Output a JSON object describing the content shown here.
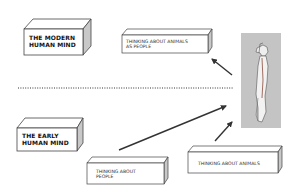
{
  "diagram": {
    "boxes": [
      {
        "id": "modern-mind",
        "lines": [
          "THE MODERN",
          "HUMAN MIND"
        ]
      },
      {
        "id": "animals-as-people",
        "lines": [
          "THINKING ABOUT ANIMALS",
          "AS PEOPLE"
        ]
      },
      {
        "id": "early-mind",
        "lines": [
          "THE EARLY",
          "HUMAN MIND"
        ]
      },
      {
        "id": "thinking-people",
        "lines": [
          "THINKING ABOUT",
          "PEOPLE"
        ]
      },
      {
        "id": "thinking-animals",
        "lines": [
          "THINKING ABOUT ANIMALS"
        ]
      }
    ],
    "figure": {
      "description": "human-animal hybrid figure",
      "background": "#c4c4c4"
    },
    "colors": {
      "stroke": "#333333",
      "side": "#c8c8c8",
      "text": "#111111"
    }
  }
}
